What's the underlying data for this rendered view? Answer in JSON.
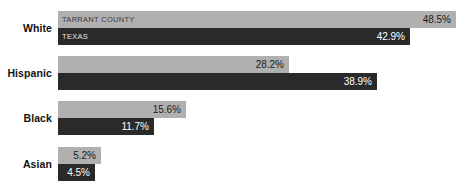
{
  "chart_data": {
    "type": "bar",
    "title": "",
    "xlabel": "",
    "ylabel": "",
    "orientation": "horizontal",
    "grid": false,
    "legend_position": "in-bar-first-group",
    "xlim": [
      0,
      48.5
    ],
    "categories": [
      "White",
      "Hispanic",
      "Black",
      "Asian"
    ],
    "series": [
      {
        "name": "TARRANT COUNTY",
        "color": "#b0b0b0",
        "values": [
          48.5,
          28.2,
          15.6,
          5.2
        ],
        "labels": [
          "48.5%",
          "28.2%",
          "15.6%",
          "5.2%"
        ]
      },
      {
        "name": "TEXAS",
        "color": "#2a2a2a",
        "values": [
          42.9,
          38.9,
          11.7,
          4.5
        ],
        "labels": [
          "42.9%",
          "38.9%",
          "11.7%",
          "4.5%"
        ]
      }
    ]
  },
  "colors": {
    "background": "#ffffff",
    "series_light": "#b0b0b0",
    "series_dark": "#2a2a2a",
    "label_text": "#111111"
  }
}
